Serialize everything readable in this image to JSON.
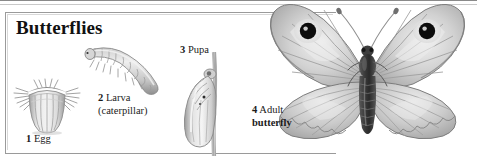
{
  "figure": {
    "title": "Butterflies",
    "style": "grayscale pencil illustration",
    "stages": [
      {
        "number": "1",
        "name": "Egg",
        "secondary": "",
        "icon": "butterfly-egg-illustration"
      },
      {
        "number": "2",
        "name": "Larva",
        "secondary": "(caterpillar)",
        "icon": "caterpillar-illustration"
      },
      {
        "number": "3",
        "name": "Pupa",
        "secondary": "",
        "icon": "chrysalis-illustration"
      },
      {
        "number": "4",
        "name": "Adult",
        "secondary": "butterfly",
        "icon": "adult-butterfly-illustration"
      }
    ],
    "colors": {
      "frame": "#9a9a9a",
      "text": "#1b1b1b",
      "background": "#ffffff",
      "art_light": "#e9e9e9",
      "art_mid": "#b5b5b5",
      "art_dark": "#6e6e6e",
      "eyespot": "#101010"
    }
  }
}
